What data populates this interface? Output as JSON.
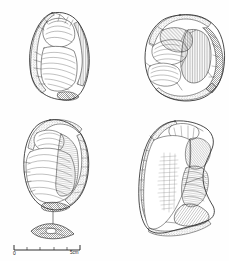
{
  "figure": {
    "type": "archaeological-lithic-illustration",
    "medium": "pen-and-ink line drawing with hatched shading",
    "background_color": "#fefefe",
    "ink_color": "#2b2b2b",
    "artifact_count": 4,
    "panels": [
      {
        "id": "upper-left",
        "name": "artifact-upper-left",
        "description": "Elongated ovate flint core, dorsal view, cortical and flaked surfaces with parallel hatching",
        "position": {
          "x": 26,
          "y": 12,
          "width": 68,
          "height": 92
        }
      },
      {
        "id": "upper-right",
        "name": "artifact-upper-right",
        "description": "Rounded discoidal flint core, multiple flake scars with dense ripple hatching and dark shaded margin at right",
        "position": {
          "x": 140,
          "y": 14,
          "width": 84,
          "height": 88
        }
      },
      {
        "id": "lower-left",
        "name": "artifact-lower-left",
        "description": "Ovate flake, ventral view, bulb of percussion with concentric ripples and retouched right edge",
        "position": {
          "x": 20,
          "y": 118,
          "width": 72,
          "height": 100
        }
      },
      {
        "id": "lower-right",
        "name": "artifact-lower-right",
        "description": "Large triangular flake, ventral view, smooth surface with faint ripples and hatched dorsal flake scars at right",
        "position": {
          "x": 135,
          "y": 120,
          "width": 90,
          "height": 116
        }
      }
    ],
    "cross_section": {
      "name": "cross-section-profile",
      "description": "Lens-shaped transverse cross-section profile shown below the lower-left artifact, linked by a vertical tie line",
      "position": {
        "x": 30,
        "y": 207,
        "width": 44,
        "height": 28
      }
    }
  },
  "scale_bar": {
    "name": "scale-bar",
    "start_label": "0",
    "end_label": "5cm",
    "unit": "cm",
    "length_cm": 5,
    "divisions": 5,
    "pixel_start": 14,
    "pixel_end": 80,
    "color": "#1a1a1a"
  }
}
